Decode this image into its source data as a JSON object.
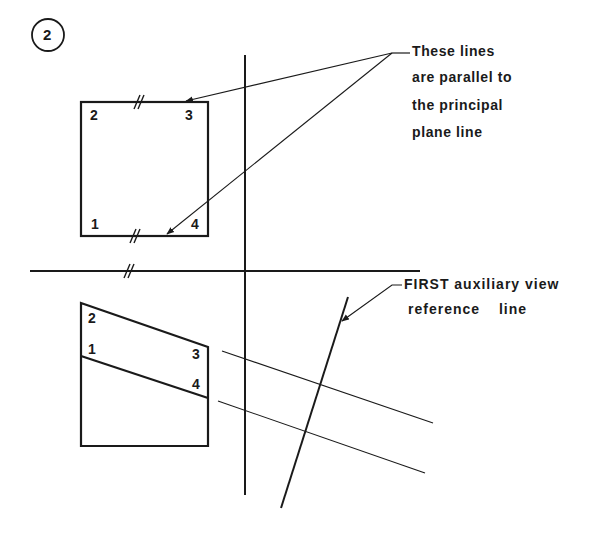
{
  "step_badge": {
    "label": "2"
  },
  "top_view": {
    "corners": [
      {
        "label": "2"
      },
      {
        "label": "3"
      },
      {
        "label": "1"
      },
      {
        "label": "4"
      }
    ]
  },
  "front_view": {
    "corners": [
      {
        "label": "2"
      },
      {
        "label": "1"
      },
      {
        "label": "3"
      },
      {
        "label": "4"
      }
    ]
  },
  "annotations": {
    "parallel_note": [
      "These lines",
      "are parallel to",
      "the principal",
      "plane line"
    ],
    "auxiliary_note": [
      "FIRST auxiliary view",
      "reference line"
    ]
  },
  "colors": {
    "ink": "#1a1a1a",
    "background": "#ffffff"
  }
}
